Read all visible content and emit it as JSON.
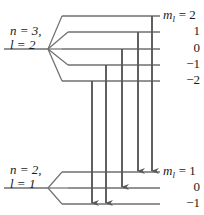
{
  "figure": {
    "title_fragment": "",
    "colors": {
      "line": "#6f6f6f",
      "arrow": "#595959",
      "text": "#1a1a1a",
      "background": "#ffffff"
    }
  },
  "upper_state": {
    "line1": "n = 3,",
    "line2": "l = 2",
    "n": 3,
    "l": 2,
    "vertex": {
      "x": 48,
      "y": 49
    },
    "stem_x_start": 4,
    "level_x_start": 62,
    "level_x_end": 160,
    "sublevels": [
      {
        "m_symbol": "m",
        "m_sub": "l",
        "eq": "=",
        "value": "2",
        "label": "2",
        "y": 16,
        "fan_x": 62,
        "show_m": true
      },
      {
        "m_symbol": "m",
        "m_sub": "l",
        "eq": "=",
        "value": "1",
        "label": "1",
        "y": 32,
        "fan_x": 68,
        "show_m": false
      },
      {
        "m_symbol": "m",
        "m_sub": "l",
        "eq": "=",
        "value": "0",
        "label": "0",
        "y": 49,
        "fan_x": 62,
        "show_m": false
      },
      {
        "m_symbol": "m",
        "m_sub": "l",
        "eq": "=",
        "value": "-1",
        "label": "−1",
        "y": 65,
        "fan_x": 68,
        "show_m": false
      },
      {
        "m_symbol": "m",
        "m_sub": "l",
        "eq": "=",
        "value": "-2",
        "label": "−2",
        "y": 81,
        "fan_x": 62,
        "show_m": false
      }
    ]
  },
  "lower_state": {
    "line1": "n = 2,",
    "line2": "l = 1",
    "n": 2,
    "l": 1,
    "vertex": {
      "x": 48,
      "y": 188
    },
    "stem_x_start": 4,
    "level_x_start": 62,
    "level_x_end": 160,
    "sublevels": [
      {
        "m_symbol": "m",
        "m_sub": "l",
        "eq": "=",
        "value": "1",
        "label": "1",
        "y": 172,
        "fan_x": 62,
        "show_m": true
      },
      {
        "m_symbol": "m",
        "m_sub": "l",
        "eq": "=",
        "value": "0",
        "label": "0",
        "y": 188,
        "fan_x": 68,
        "show_m": false
      },
      {
        "m_symbol": "m",
        "m_sub": "l",
        "eq": "=",
        "value": "-1",
        "label": "−1",
        "y": 204,
        "fan_x": 62,
        "show_m": false
      }
    ]
  },
  "transitions": [
    {
      "id": "t1",
      "x": 92,
      "from_m": "-2",
      "to_m": "-1",
      "y_start": 81,
      "y_end": 204
    },
    {
      "id": "t2",
      "x": 106,
      "from_m": "-1",
      "to_m": "-1",
      "y_start": 65,
      "y_end": 204
    },
    {
      "id": "t3",
      "x": 122,
      "from_m": "0",
      "to_m": "0",
      "y_start": 49,
      "y_end": 188
    },
    {
      "id": "t4",
      "x": 138,
      "from_m": "1",
      "to_m": "1",
      "y_start": 32,
      "y_end": 172
    },
    {
      "id": "t5",
      "x": 152,
      "from_m": "2",
      "to_m": "1",
      "y_start": 16,
      "y_end": 172
    }
  ],
  "label_positions": {
    "upper_state_x": 10,
    "upper_state_y": 24,
    "lower_state_x": 10,
    "lower_state_y": 163,
    "m_label_x": 163,
    "num_label_x": 178
  }
}
